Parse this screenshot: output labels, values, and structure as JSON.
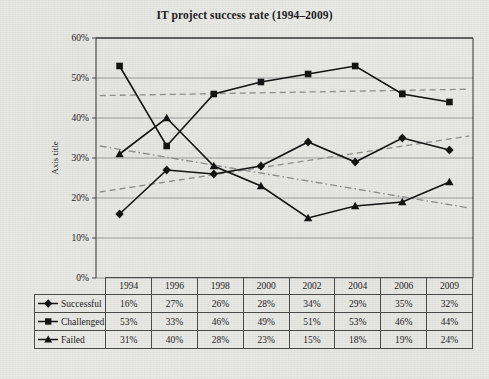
{
  "chart_data": {
    "type": "line",
    "title": "IT project success rate (1994–2009)",
    "xlabel": "",
    "ylabel": "Axis title",
    "ylim": [
      0,
      60
    ],
    "ytick_labels": [
      "0%",
      "10%",
      "20%",
      "30%",
      "40%",
      "50%",
      "60%"
    ],
    "ytick_values": [
      0,
      10,
      20,
      30,
      40,
      50,
      60
    ],
    "grid": "horizontal",
    "legend_position": "table-left-column",
    "categories": [
      "1994",
      "1996",
      "1998",
      "2000",
      "2002",
      "2004",
      "2006",
      "2009"
    ],
    "series": [
      {
        "name": "Successful",
        "marker": "diamond",
        "values": [
          16,
          27,
          26,
          28,
          34,
          29,
          35,
          32
        ],
        "labels": [
          "16%",
          "27%",
          "26%",
          "28%",
          "34%",
          "29%",
          "35%",
          "32%"
        ],
        "trendline": {
          "style": "dashed",
          "from": 21.5,
          "to": 35.5
        }
      },
      {
        "name": "Challenged",
        "marker": "square",
        "values": [
          53,
          33,
          46,
          49,
          51,
          53,
          46,
          44
        ],
        "labels": [
          "53%",
          "33%",
          "46%",
          "49%",
          "51%",
          "53%",
          "46%",
          "44%"
        ],
        "trendline": {
          "style": "dashed",
          "from": 45.6,
          "to": 47.2
        }
      },
      {
        "name": "Failed",
        "marker": "triangle",
        "values": [
          31,
          40,
          28,
          23,
          15,
          18,
          19,
          24
        ],
        "labels": [
          "31%",
          "40%",
          "28%",
          "23%",
          "15%",
          "18%",
          "19%",
          "24%"
        ],
        "trendline": {
          "style": "dash-dot",
          "from": 33.0,
          "to": 17.5
        }
      }
    ],
    "colors": {
      "line": "#111111",
      "trendline": "#8f8f8f",
      "grid": "#8a8a8a",
      "axis": "#333333",
      "background": "#e9e9e6",
      "text": "#1a1a1a"
    }
  }
}
